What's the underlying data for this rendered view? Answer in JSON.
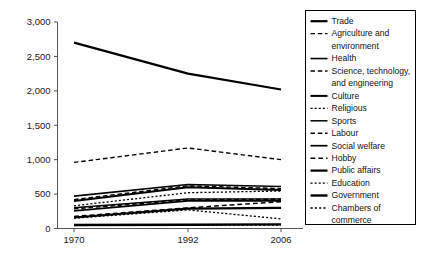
{
  "chart_data": {
    "type": "line",
    "title": "",
    "xlabel": "",
    "ylabel": "",
    "x": [
      "1970",
      "1992",
      "2006"
    ],
    "categories": [
      "1970",
      "1992",
      "2006"
    ],
    "ylim": [
      0,
      3000
    ],
    "yticks": [
      0,
      500,
      1000,
      1500,
      2000,
      2500,
      3000
    ],
    "ytick_labels": [
      "0",
      "500",
      "1,000",
      "1,500",
      "2,000",
      "2,500",
      "3,000"
    ],
    "xtick_labels": [
      "1970",
      "1992",
      "2006"
    ],
    "grid": false,
    "legend_position": "right",
    "series": [
      {
        "name": "Trade",
        "style": "solid",
        "width": 2.2,
        "values": [
          2700,
          2250,
          2020
        ]
      },
      {
        "name": "Agriculture and environment",
        "style": "dashed",
        "width": 1.4,
        "values": [
          960,
          1170,
          1000
        ]
      },
      {
        "name": "Health",
        "style": "solid",
        "width": 1.6,
        "values": [
          470,
          640,
          610
        ]
      },
      {
        "name": "Science, technology, and engineering",
        "style": "dashed",
        "width": 1.4,
        "values": [
          420,
          620,
          580
        ]
      },
      {
        "name": "Culture",
        "style": "solid",
        "width": 2.0,
        "values": [
          400,
          600,
          560
        ]
      },
      {
        "name": "Religious",
        "style": "dotted",
        "width": 1.3,
        "values": [
          330,
          520,
          545
        ]
      },
      {
        "name": "Sports",
        "style": "solid",
        "width": 1.5,
        "values": [
          300,
          430,
          430
        ]
      },
      {
        "name": "Labour",
        "style": "dashed",
        "width": 1.4,
        "values": [
          285,
          415,
          425
        ]
      },
      {
        "name": "Social welfare",
        "style": "solid",
        "width": 1.7,
        "values": [
          255,
          400,
          400
        ]
      },
      {
        "name": "Hobby",
        "style": "dashed",
        "width": 1.5,
        "values": [
          175,
          300,
          390
        ]
      },
      {
        "name": "Public affairs",
        "style": "solid",
        "width": 2.2,
        "values": [
          160,
          290,
          300
        ]
      },
      {
        "name": "Education",
        "style": "dotted",
        "width": 1.3,
        "values": [
          150,
          270,
          140
        ]
      },
      {
        "name": "Government",
        "style": "solid",
        "width": 2.4,
        "values": [
          50,
          55,
          60
        ]
      },
      {
        "name": "Chambers of commerce",
        "style": "dotted",
        "width": 1.4,
        "values": [
          45,
          48,
          50
        ]
      }
    ]
  },
  "legend": {
    "entries": [
      {
        "label": "Trade"
      },
      {
        "label": "Agriculture and"
      },
      {
        "label": "environment"
      },
      {
        "label": "Health"
      },
      {
        "label": "Science, technology,"
      },
      {
        "label": "and engineering"
      },
      {
        "label": "Culture"
      },
      {
        "label": "Religious"
      },
      {
        "label": "Sports"
      },
      {
        "label": "Labour"
      },
      {
        "label": "Social welfare"
      },
      {
        "label": "Hobby"
      },
      {
        "label": "Public affairs"
      },
      {
        "label": "Education"
      },
      {
        "label": "Government"
      },
      {
        "label": "Chambers of"
      },
      {
        "label": "commerce"
      }
    ]
  },
  "colors": {
    "line": "#000000",
    "axis": "#555555",
    "text": "#111111",
    "background": "#ffffff"
  }
}
